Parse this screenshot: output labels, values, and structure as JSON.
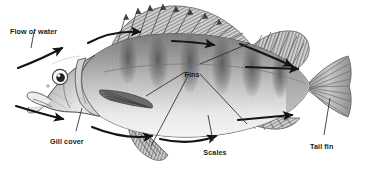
{
  "figure": {
    "view": "lateral left-facing",
    "style": "grayscale pencil/stipple scientific illustration",
    "background_color": "#ffffff",
    "ink_color": "#1b1b1b"
  },
  "labels": [
    {
      "id": "flow-of-water",
      "text": "Flow of water",
      "x": 10,
      "y": 27,
      "anchor": "start"
    },
    {
      "id": "fins",
      "text": "Fins",
      "x": 192,
      "y": 70,
      "anchor": "middle"
    },
    {
      "id": "gill-cover",
      "text": "Gill cover",
      "x": 50,
      "y": 137,
      "anchor": "start"
    },
    {
      "id": "scales",
      "text": "Scales",
      "x": 215,
      "y": 148,
      "anchor": "middle"
    },
    {
      "id": "tail-fin",
      "text": "Tail fin",
      "x": 310,
      "y": 142,
      "anchor": "start"
    }
  ],
  "leader_lines": [
    {
      "id": "leader-flow-of-water",
      "from": "flow-of-water",
      "d": "M 34 32 L 31 48"
    },
    {
      "id": "leader-fins-dorsal",
      "from": "fins",
      "d": "M 200 64 L 250 43"
    },
    {
      "id": "leader-fins-pectoral",
      "from": "fins",
      "d": "M 185 72 L 146 96"
    },
    {
      "id": "leader-fins-pelvic",
      "from": "fins",
      "d": "M 189 74 L 151 146"
    },
    {
      "id": "leader-fins-anal",
      "from": "fins",
      "d": "M 200 74 L 247 124"
    },
    {
      "id": "leader-gill-cover",
      "from": "gill-cover",
      "d": "M 76 131 L 82 108"
    },
    {
      "id": "leader-scales",
      "from": "scales",
      "d": "M 213 141 L 208 115"
    },
    {
      "id": "leader-tail-fin",
      "from": "tail-fin",
      "d": "M 324 135 L 330 98"
    }
  ],
  "flow_arrows": [
    {
      "id": "arrow-snout-upper",
      "description": "curved arrow sweeping up toward the snout",
      "d": "M 18 68 Q 44 58 62 48"
    },
    {
      "id": "arrow-snout-lower",
      "description": "curved arrow sweeping down toward the lower jaw",
      "d": "M 16 106 Q 42 114 63 119"
    },
    {
      "id": "arrow-dorsal-front",
      "description": "arrow along the back before the spiny dorsal fin",
      "d": "M 88 43 Q 112 30 140 32"
    },
    {
      "id": "arrow-dorsal-mid",
      "description": "arrow across the spiny dorsal fin base",
      "d": "M 172 41 Q 196 42 214 45"
    },
    {
      "id": "arrow-dorsal-rear",
      "description": "arrow across the soft dorsal fin",
      "d": "M 240 44 Q 268 55 292 66"
    },
    {
      "id": "arrow-caudal-top",
      "description": "arrow running to the upper tail",
      "d": "M 246 67 L 298 69"
    },
    {
      "id": "arrow-belly-front",
      "description": "curved arrow under the head and belly",
      "d": "M 92 127 Q 124 140 152 136"
    },
    {
      "id": "arrow-belly-rear",
      "description": "curved arrow along the lower body",
      "d": "M 160 139 Q 190 146 216 136"
    },
    {
      "id": "arrow-caudal-low",
      "description": "arrow running to the lower tail",
      "d": "M 238 120 L 292 115"
    }
  ],
  "anatomy": [
    {
      "id": "spiny-dorsal-fin",
      "name": "spiny dorsal fin"
    },
    {
      "id": "soft-dorsal-fin",
      "name": "soft dorsal fin"
    },
    {
      "id": "pectoral-fin",
      "name": "pectoral fin"
    },
    {
      "id": "pelvic-fin",
      "name": "pelvic fin"
    },
    {
      "id": "anal-fin",
      "name": "anal fin"
    },
    {
      "id": "caudal-fin",
      "name": "caudal (tail) fin"
    },
    {
      "id": "operculum",
      "name": "gill cover (operculum)"
    },
    {
      "id": "eye",
      "name": "eye"
    },
    {
      "id": "mouth",
      "name": "mouth"
    },
    {
      "id": "lateral-line",
      "name": "lateral line"
    },
    {
      "id": "body-bars",
      "name": "dark vertical bars",
      "count": 6
    }
  ]
}
